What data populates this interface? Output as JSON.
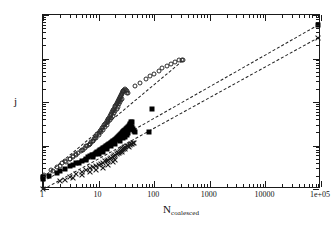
{
  "figure": {
    "background_color": "#ffffff",
    "frame_color": "#1a1a1a"
  },
  "axes": {
    "x": {
      "label_main": "N",
      "label_sub": "coalesced",
      "scale": "log",
      "min": 1,
      "max": 100000,
      "ticks": [
        "1",
        "10",
        "100",
        "1000",
        "10000",
        "1e+05"
      ]
    },
    "y": {
      "label": "j",
      "scale": "log",
      "min": 1,
      "max": 10000,
      "ticks": [
        "1",
        "10",
        "100",
        "1000",
        "10000"
      ]
    }
  },
  "chart_data": {
    "type": "scatter",
    "title": "",
    "xlabel": "N_coalesced",
    "ylabel": "j",
    "xscale": "log",
    "yscale": "log",
    "xlim": [
      1,
      100000
    ],
    "ylim": [
      1,
      10000
    ],
    "grid": false,
    "legend": "none",
    "series": [
      {
        "name": "open-circles",
        "marker": "open-circle",
        "color": "#2b2b2b",
        "points": [
          [
            1.0,
            2.0
          ],
          [
            1.05,
            2.1
          ],
          [
            1.5,
            2.6
          ],
          [
            2.0,
            3.4
          ],
          [
            2.6,
            4.2
          ],
          [
            3.0,
            4.8
          ],
          [
            3.4,
            5.3
          ],
          [
            3.9,
            6.0
          ],
          [
            4.3,
            6.6
          ],
          [
            4.8,
            7.3
          ],
          [
            5.3,
            8.0
          ],
          [
            5.8,
            8.8
          ],
          [
            6.2,
            9.6
          ],
          [
            6.7,
            10.5
          ],
          [
            7.0,
            11.0
          ],
          [
            7.4,
            12.0
          ],
          [
            7.8,
            13.0
          ],
          [
            8.2,
            14.0
          ],
          [
            8.6,
            15.0
          ],
          [
            9.0,
            16.5
          ],
          [
            9.5,
            18.0
          ],
          [
            10.0,
            19.5
          ],
          [
            10.5,
            21.0
          ],
          [
            11.0,
            23.0
          ],
          [
            11.5,
            25.0
          ],
          [
            12.0,
            27.0
          ],
          [
            12.5,
            29.0
          ],
          [
            13.0,
            31.0
          ],
          [
            13.5,
            33.0
          ],
          [
            14.0,
            36.0
          ],
          [
            14.5,
            38.0
          ],
          [
            15.0,
            41.0
          ],
          [
            15.5,
            44.0
          ],
          [
            16.0,
            47.0
          ],
          [
            16.5,
            50.0
          ],
          [
            17.0,
            54.0
          ],
          [
            17.5,
            58.0
          ],
          [
            18.0,
            62.0
          ],
          [
            18.5,
            66.0
          ],
          [
            19.0,
            70.0
          ],
          [
            19.5,
            75.0
          ],
          [
            20.0,
            80.0
          ],
          [
            20.5,
            85.0
          ],
          [
            21.0,
            90.0
          ],
          [
            21.5,
            95.0
          ],
          [
            22.0,
            100.0
          ],
          [
            22.5,
            106.0
          ],
          [
            23.0,
            112.0
          ],
          [
            23.5,
            118.0
          ],
          [
            24.0,
            124.0
          ],
          [
            24.5,
            130.0
          ],
          [
            25.0,
            138.0
          ],
          [
            25.5,
            145.0
          ],
          [
            26.0,
            152.0
          ],
          [
            26.5,
            160.0
          ],
          [
            27.0,
            168.0
          ],
          [
            27.5,
            175.0
          ],
          [
            28.0,
            183.0
          ],
          [
            29.0,
            192.0
          ],
          [
            30.0,
            200.0
          ],
          [
            31.0,
            190.0
          ],
          [
            32.0,
            175.0
          ],
          [
            33.0,
            165.0
          ],
          [
            34.0,
            158.0
          ],
          [
            26.0,
            120.0
          ],
          [
            25.0,
            110.0
          ],
          [
            24.0,
            98.0
          ],
          [
            23.0,
            88.0
          ],
          [
            22.0,
            78.0
          ],
          [
            21.0,
            70.0
          ],
          [
            20.0,
            62.0
          ],
          [
            19.0,
            55.0
          ],
          [
            18.0,
            48.0
          ],
          [
            17.0,
            43.0
          ],
          [
            16.0,
            38.0
          ],
          [
            15.0,
            34.0
          ],
          [
            14.0,
            30.0
          ],
          [
            13.0,
            26.0
          ],
          [
            12.0,
            23.0
          ],
          [
            11.0,
            20.0
          ],
          [
            10.0,
            17.5
          ],
          [
            9.0,
            15.0
          ],
          [
            8.0,
            13.0
          ],
          [
            7.0,
            11.0
          ],
          [
            6.0,
            9.5
          ],
          [
            5.0,
            8.0
          ],
          [
            4.0,
            6.5
          ],
          [
            3.5,
            5.7
          ],
          [
            3.0,
            5.0
          ],
          [
            2.5,
            4.3
          ],
          [
            2.2,
            3.9
          ],
          [
            1.8,
            3.2
          ],
          [
            1.4,
            2.7
          ],
          [
            45.0,
            230.0
          ],
          [
            55.0,
            280.0
          ],
          [
            70.0,
            340.0
          ],
          [
            85.0,
            400.0
          ],
          [
            100.0,
            450.0
          ],
          [
            120.0,
            520.0
          ],
          [
            140.0,
            600.0
          ],
          [
            170.0,
            680.0
          ],
          [
            200.0,
            760.0
          ],
          [
            240.0,
            840.0
          ],
          [
            280.0,
            900.0
          ],
          [
            310.0,
            910.0
          ],
          [
            330.0,
            900.0
          ]
        ]
      },
      {
        "name": "filled-squares",
        "marker": "filled-square",
        "color": "#000000",
        "points": [
          [
            1.0,
            1.7
          ],
          [
            1.0,
            1.9
          ],
          [
            2.0,
            2.6
          ],
          [
            3.0,
            3.3
          ],
          [
            4.0,
            3.9
          ],
          [
            5.0,
            4.4
          ],
          [
            6.0,
            5.0
          ],
          [
            6.5,
            5.3
          ],
          [
            7.0,
            5.6
          ],
          [
            7.5,
            5.9
          ],
          [
            8.0,
            6.2
          ],
          [
            8.5,
            6.5
          ],
          [
            9.0,
            6.8
          ],
          [
            9.5,
            7.1
          ],
          [
            10.0,
            7.4
          ],
          [
            10.5,
            7.7
          ],
          [
            11.0,
            8.0
          ],
          [
            11.5,
            8.3
          ],
          [
            12.0,
            8.6
          ],
          [
            12.5,
            8.9
          ],
          [
            13.0,
            9.2
          ],
          [
            13.5,
            9.5
          ],
          [
            14.0,
            9.8
          ],
          [
            14.5,
            10.1
          ],
          [
            15.0,
            10.4
          ],
          [
            15.5,
            10.7
          ],
          [
            16.0,
            11.0
          ],
          [
            16.5,
            11.3
          ],
          [
            17.0,
            11.6
          ],
          [
            17.5,
            12.0
          ],
          [
            18.0,
            12.3
          ],
          [
            18.5,
            12.6
          ],
          [
            19.0,
            13.0
          ],
          [
            19.5,
            13.3
          ],
          [
            20.0,
            13.7
          ],
          [
            20.5,
            14.0
          ],
          [
            21.0,
            14.4
          ],
          [
            21.5,
            14.8
          ],
          [
            22.0,
            15.2
          ],
          [
            22.5,
            15.6
          ],
          [
            23.0,
            16.0
          ],
          [
            23.5,
            16.4
          ],
          [
            24.0,
            16.8
          ],
          [
            24.5,
            17.2
          ],
          [
            25.0,
            17.6
          ],
          [
            25.5,
            18.0
          ],
          [
            26.0,
            18.5
          ],
          [
            26.5,
            19.0
          ],
          [
            27.0,
            19.5
          ],
          [
            27.5,
            20.0
          ],
          [
            28.0,
            20.5
          ],
          [
            28.5,
            21.0
          ],
          [
            29.0,
            21.5
          ],
          [
            29.5,
            22.0
          ],
          [
            30.0,
            22.5
          ],
          [
            31.0,
            23.5
          ],
          [
            32.0,
            24.5
          ],
          [
            33.0,
            25.5
          ],
          [
            34.0,
            26.5
          ],
          [
            35.0,
            27.5
          ],
          [
            36.0,
            29.0
          ],
          [
            37.0,
            30.5
          ],
          [
            38.0,
            32.0
          ],
          [
            39.0,
            34.0
          ],
          [
            40.0,
            35.0
          ],
          [
            36.0,
            24.0
          ],
          [
            38.0,
            25.0
          ],
          [
            40.0,
            26.0
          ],
          [
            42.0,
            24.0
          ],
          [
            44.0,
            22.0
          ],
          [
            46.0,
            20.5
          ],
          [
            34.0,
            19.0
          ],
          [
            32.0,
            17.5
          ],
          [
            30.0,
            16.0
          ],
          [
            28.0,
            15.0
          ],
          [
            24.0,
            13.0
          ],
          [
            20.0,
            11.0
          ],
          [
            17.0,
            9.5
          ],
          [
            14.0,
            8.2
          ],
          [
            12.0,
            7.2
          ],
          [
            10.0,
            6.4
          ],
          [
            8.0,
            5.5
          ],
          [
            6.0,
            4.7
          ],
          [
            4.5,
            4.0
          ],
          [
            3.5,
            3.5
          ],
          [
            2.5,
            2.9
          ],
          [
            1.8,
            2.3
          ],
          [
            1.3,
            2.0
          ],
          [
            90.0,
            70.0
          ],
          [
            80.0,
            20.0
          ],
          [
            90000.0,
            6000.0
          ]
        ]
      },
      {
        "name": "x-crosses",
        "marker": "cross",
        "color": "#1a1a1a",
        "points": [
          [
            1.0,
            1.0
          ],
          [
            2.0,
            1.5
          ],
          [
            3.0,
            1.9
          ],
          [
            4.0,
            2.2
          ],
          [
            5.0,
            2.5
          ],
          [
            6.0,
            2.8
          ],
          [
            7.0,
            3.0
          ],
          [
            8.0,
            3.2
          ],
          [
            9.0,
            3.4
          ],
          [
            10.0,
            3.6
          ],
          [
            11.0,
            3.8
          ],
          [
            12.0,
            4.0
          ],
          [
            13.0,
            4.3
          ],
          [
            14.0,
            4.5
          ],
          [
            15.0,
            4.7
          ],
          [
            16.0,
            5.0
          ],
          [
            17.0,
            5.2
          ],
          [
            18.0,
            5.5
          ],
          [
            19.0,
            5.8
          ],
          [
            20.0,
            6.0
          ],
          [
            21.0,
            6.3
          ],
          [
            22.0,
            6.6
          ],
          [
            23.0,
            6.9
          ],
          [
            24.0,
            7.2
          ],
          [
            25.0,
            7.5
          ],
          [
            26.0,
            7.8
          ],
          [
            27.0,
            8.1
          ],
          [
            28.0,
            8.4
          ],
          [
            29.0,
            8.7
          ],
          [
            30.0,
            9.0
          ],
          [
            32.0,
            9.5
          ],
          [
            34.0,
            10.0
          ],
          [
            36.0,
            10.4
          ],
          [
            38.0,
            10.8
          ],
          [
            40.0,
            11.0
          ],
          [
            42.0,
            11.2
          ],
          [
            44.0,
            11.3
          ],
          [
            20.0,
            4.7
          ],
          [
            18.0,
            4.2
          ],
          [
            15.0,
            3.6
          ],
          [
            12.0,
            3.1
          ],
          [
            9.0,
            2.7
          ],
          [
            7.0,
            2.4
          ],
          [
            5.0,
            2.1
          ],
          [
            3.5,
            1.8
          ],
          [
            2.5,
            1.6
          ],
          [
            26.0,
            7.0
          ],
          [
            30.0,
            8.2
          ],
          [
            35.0,
            9.3
          ],
          [
            90000.0,
            3000.0
          ]
        ]
      }
    ],
    "fit_lines": [
      {
        "name": "fit-circles",
        "x1": 1.0,
        "y1": 1.9,
        "x2": 330.0,
        "y2": 930.0
      },
      {
        "name": "fit-squares",
        "x1": 1.0,
        "y1": 1.55,
        "x2": 90000.0,
        "y2": 6200.0
      },
      {
        "name": "fit-crosses",
        "x1": 1.0,
        "y1": 1.0,
        "x2": 90000.0,
        "y2": 3100.0
      }
    ]
  }
}
